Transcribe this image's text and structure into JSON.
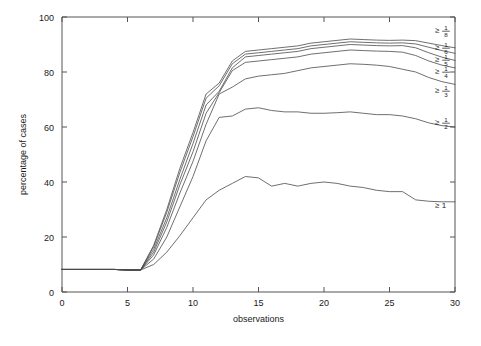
{
  "chart_data": {
    "type": "line",
    "title": "",
    "xlabel": "observations",
    "ylabel": "percentage of cases",
    "xlim": [
      0,
      30
    ],
    "ylim": [
      0,
      100
    ],
    "xticks": [
      0,
      5,
      10,
      15,
      20,
      25,
      30
    ],
    "yticks": [
      0,
      20,
      40,
      60,
      80,
      100
    ],
    "xticklabels": [
      "0",
      "5",
      "10",
      "15",
      "20",
      "25",
      "30"
    ],
    "yticklabels": [
      "0",
      "20",
      "40",
      "60",
      "80",
      "100"
    ],
    "grid": false,
    "legend_position": "right-inline-labels",
    "x": [
      0,
      1,
      2,
      3,
      4,
      5,
      6,
      7,
      8,
      9,
      10,
      11,
      12,
      13,
      14,
      15,
      16,
      17,
      18,
      19,
      20,
      21,
      22,
      23,
      24,
      25,
      26,
      27,
      28,
      29,
      30
    ],
    "series": [
      {
        "name": "ge-one-eighth",
        "label_prefix": "≥",
        "numerator": "1",
        "denominator": "8",
        "values": [
          8.2,
          8.2,
          8.2,
          8.2,
          8.2,
          8.0,
          8.0,
          17.0,
          30.0,
          45.0,
          58.0,
          72.0,
          76.0,
          84.0,
          87.5,
          88.0,
          88.5,
          89.0,
          89.5,
          90.5,
          91.0,
          91.5,
          92.0,
          91.8,
          91.6,
          91.5,
          91.6,
          91.4,
          90.5,
          89.6,
          88.8
        ]
      },
      {
        "name": "ge-one-sixth",
        "label_prefix": "≥",
        "numerator": "1",
        "denominator": "6",
        "values": [
          8.2,
          8.2,
          8.2,
          8.2,
          8.2,
          8.0,
          8.0,
          16.5,
          29.0,
          43.5,
          56.5,
          70.5,
          75.0,
          83.0,
          86.5,
          87.0,
          87.5,
          88.0,
          88.5,
          89.5,
          90.0,
          90.5,
          91.0,
          90.8,
          90.6,
          90.5,
          90.6,
          90.2,
          89.0,
          87.8,
          86.8
        ]
      },
      {
        "name": "ge-one-fifth",
        "label_prefix": "≥",
        "numerator": "1",
        "denominator": "5",
        "values": [
          8.2,
          8.2,
          8.2,
          8.2,
          8.2,
          8.0,
          8.0,
          15.5,
          27.0,
          41.0,
          54.0,
          68.0,
          73.0,
          81.5,
          85.5,
          86.0,
          86.5,
          87.0,
          87.5,
          88.5,
          89.0,
          89.5,
          90.0,
          89.8,
          89.6,
          89.5,
          89.6,
          88.8,
          87.0,
          85.4,
          84.2
        ]
      },
      {
        "name": "ge-one-fourth",
        "label_prefix": "≥",
        "numerator": "1",
        "denominator": "4",
        "values": [
          8.2,
          8.2,
          8.2,
          8.2,
          8.2,
          8.0,
          8.0,
          14.5,
          25.5,
          39.0,
          51.0,
          65.0,
          72.5,
          80.5,
          83.5,
          84.0,
          84.5,
          85.0,
          85.5,
          86.5,
          87.0,
          87.5,
          88.0,
          87.8,
          87.6,
          87.5,
          87.2,
          86.0,
          84.0,
          82.5,
          81.5
        ]
      },
      {
        "name": "ge-one-third",
        "label_prefix": "≥",
        "numerator": "1",
        "denominator": "3",
        "values": [
          8.2,
          8.2,
          8.2,
          8.2,
          8.2,
          8.0,
          8.0,
          13.5,
          23.5,
          36.0,
          47.5,
          61.0,
          72.0,
          74.5,
          77.5,
          78.5,
          79.0,
          79.5,
          80.5,
          81.5,
          82.0,
          82.5,
          83.0,
          82.8,
          82.5,
          82.0,
          81.0,
          80.0,
          78.0,
          76.5,
          75.5
        ]
      },
      {
        "name": "ge-one-half",
        "label_prefix": "≥",
        "numerator": "1",
        "denominator": "2",
        "values": [
          8.2,
          8.2,
          8.2,
          8.2,
          8.2,
          8.0,
          8.0,
          12.0,
          20.0,
          31.0,
          42.0,
          55.0,
          63.5,
          64.0,
          66.5,
          67.0,
          66.0,
          65.5,
          65.5,
          65.0,
          65.0,
          65.2,
          65.5,
          65.0,
          64.5,
          64.5,
          64.0,
          63.0,
          61.5,
          60.5,
          60.0
        ]
      },
      {
        "name": "ge-one",
        "label_prefix": "≥",
        "numerator": "1",
        "denominator": "",
        "values": [
          8.2,
          8.2,
          8.2,
          8.2,
          8.2,
          8.0,
          8.0,
          10.0,
          14.5,
          20.5,
          27.0,
          33.5,
          37.0,
          39.5,
          42.0,
          41.5,
          38.5,
          39.5,
          38.5,
          39.5,
          40.0,
          39.5,
          38.5,
          38.0,
          37.0,
          36.5,
          36.5,
          33.5,
          33.0,
          32.8,
          32.8
        ]
      }
    ]
  }
}
